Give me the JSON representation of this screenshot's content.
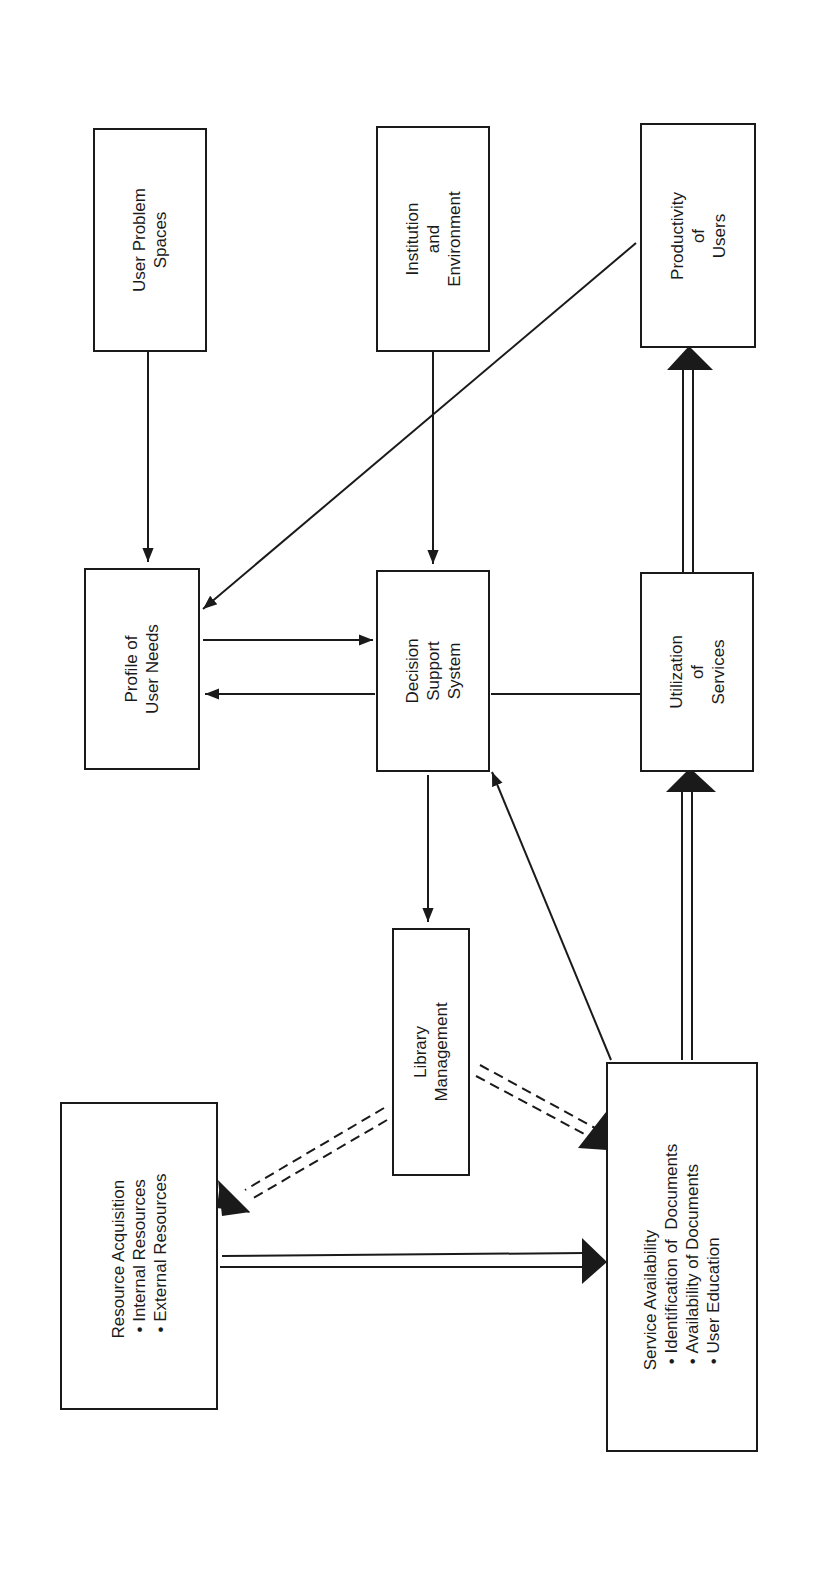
{
  "diagram": {
    "nodes": {
      "user_problem_spaces": {
        "lines": [
          "User Problem",
          "Spaces"
        ]
      },
      "institution_environment": {
        "lines": [
          "Institution",
          "and",
          "Environment"
        ]
      },
      "productivity_of_users": {
        "lines": [
          "Productivity",
          "of",
          "Users"
        ]
      },
      "profile_of_user_needs": {
        "lines": [
          "Profile of",
          "User Needs"
        ]
      },
      "decision_support_system": {
        "lines": [
          "Decision",
          "Support",
          "System"
        ]
      },
      "utilization_of_services": {
        "lines": [
          "Utilization",
          "of",
          "Services"
        ]
      },
      "library_management": {
        "lines": [
          "Library",
          "Management"
        ]
      },
      "resource_acquisition": {
        "title": "Resource Acquisition",
        "bullets": [
          "Internal Resources",
          "External Resources"
        ]
      },
      "service_availability": {
        "title": "Service Availability",
        "bullets": [
          "Identification of  Documents",
          "Availability of Documents",
          "User Education"
        ]
      }
    },
    "edges": [
      {
        "from": "User Problem Spaces",
        "to": "Profile of User Needs",
        "style": "single-arrow"
      },
      {
        "from": "Institution and Environment",
        "to": "Decision Support System",
        "style": "single-arrow"
      },
      {
        "from": "Productivity of Users",
        "to": "Profile of User Needs",
        "style": "single-arrow"
      },
      {
        "from": "Profile of User Needs",
        "to": "Decision Support System",
        "style": "single-arrow"
      },
      {
        "from": "Decision Support System",
        "to": "Profile of User Needs",
        "style": "single-arrow"
      },
      {
        "from": "Decision Support System",
        "to": "Utilization of Services",
        "style": "line"
      },
      {
        "from": "Utilization of Services",
        "to": "Productivity of Users",
        "style": "double-line-arrow"
      },
      {
        "from": "Decision Support System",
        "to": "Library Management",
        "style": "single-arrow"
      },
      {
        "from": "Service Availability",
        "to": "Decision Support System",
        "style": "single-arrow"
      },
      {
        "from": "Service Availability",
        "to": "Utilization of Services",
        "style": "double-line-arrow"
      },
      {
        "from": "Library Management",
        "to": "Resource Acquisition",
        "style": "double-dashed-arrow"
      },
      {
        "from": "Library Management",
        "to": "Service Availability",
        "style": "double-dashed-arrow"
      },
      {
        "from": "Resource Acquisition",
        "to": "Service Availability",
        "style": "double-line-arrow"
      }
    ],
    "colors": {
      "ink": "#1a1a1a",
      "paper": "#ffffff"
    }
  }
}
